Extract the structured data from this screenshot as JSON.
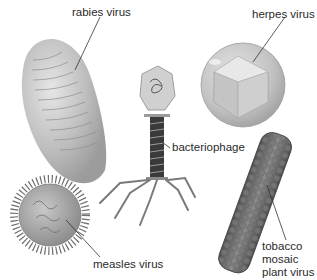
{
  "diagram": {
    "labels": {
      "rabies": "rabies virus",
      "herpes": "herpes virus",
      "bacteriophage": "bacteriophage",
      "measles": "measles virus",
      "tobacco_line1": "tobacco",
      "tobacco_line2": "mosaic",
      "tobacco_line3": "plant virus"
    },
    "viruses": [
      {
        "id": "rabies",
        "shape": "bullet/elongated oval",
        "color": "#bdbdbd"
      },
      {
        "id": "herpes",
        "shape": "icosahedron in sphere",
        "color": "#c9c9c9"
      },
      {
        "id": "bacteriophage",
        "shape": "head, tail, legs",
        "color": "#8a8a8a"
      },
      {
        "id": "measles",
        "shape": "spiked sphere",
        "color": "#9a9a9a"
      },
      {
        "id": "tobacco",
        "shape": "helical rod",
        "color": "#6e6e6e"
      }
    ]
  }
}
